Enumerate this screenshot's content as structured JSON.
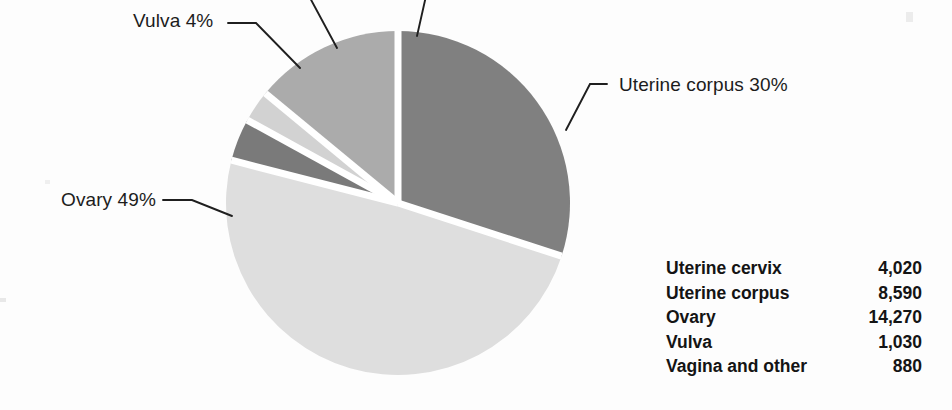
{
  "chart_data": {
    "type": "pie",
    "title": "",
    "subtitle": "",
    "xlabel": "",
    "ylabel": "",
    "legend_position": "right-table",
    "grid": false,
    "categories": [
      "Uterine cervix",
      "Uterine corpus",
      "Ovary",
      "Vulva",
      "Vagina and other"
    ],
    "values": [
      4020,
      8590,
      14270,
      1030,
      880
    ],
    "percents": [
      14,
      30,
      49,
      4,
      3
    ],
    "value_labels": [
      "4,020",
      "8,590",
      "14,270",
      "1,030",
      "880"
    ],
    "colors": [
      "#ababab",
      "#808080",
      "#dedede",
      "#7a7a7a",
      "#d2d2d2"
    ],
    "slices": [
      {
        "name": "Uterine corpus",
        "label_text": "Uterine corpus 30%",
        "percent": 30,
        "value": 8590,
        "color": "#808080",
        "start_angle": 0,
        "end_angle": 108
      },
      {
        "name": "Ovary",
        "label_text": "Ovary 49%",
        "percent": 49,
        "value": 14270,
        "color": "#dedede",
        "start_angle": 108,
        "end_angle": 284.4
      },
      {
        "name": "Vulva",
        "label_text": "Vulva 4%",
        "percent": 4,
        "value": 1030,
        "color": "#7a7a7a",
        "start_angle": 284.4,
        "end_angle": 298.8
      },
      {
        "name": "Vagina and other",
        "label_text": "Vagina and other 3%",
        "percent": 3,
        "value": 880,
        "color": "#d2d2d2",
        "start_angle": 298.8,
        "end_angle": 309.6
      },
      {
        "name": "Uterine cervix",
        "label_text": "Uterine cervix 14%",
        "percent": 14,
        "value": 4020,
        "color": "#ababab",
        "start_angle": 309.6,
        "end_angle": 360
      }
    ]
  },
  "callouts": {
    "vulva": "Vulva 4%",
    "ovary": "Ovary 49%",
    "uterine_corpus": "Uterine corpus 30%"
  },
  "table": {
    "rows": [
      {
        "site": "Uterine cervix",
        "count": "4,020"
      },
      {
        "site": "Uterine corpus",
        "count": "8,590"
      },
      {
        "site": "Ovary",
        "count": "14,270"
      },
      {
        "site": "Vulva",
        "count": "1,030"
      },
      {
        "site": "Vagina and other",
        "count": "880"
      }
    ]
  },
  "colors": {
    "background": "#fdfdfd",
    "text": "#141414",
    "leader_line": "#1f1f1f",
    "slice_divider": "#ffffff"
  }
}
